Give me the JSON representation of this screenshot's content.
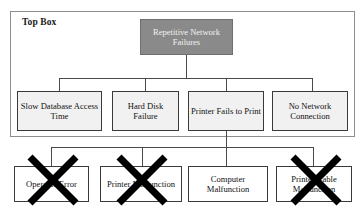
{
  "diagram": {
    "title_label": "Top Box",
    "root": {
      "label": "Repetitive Network Failures",
      "fill_color": "#8a8a8a",
      "text_color": "#f2f2f2"
    },
    "level2": [
      {
        "label": "Slow Database Access Time",
        "struck_out": false
      },
      {
        "label": "Hard Disk Failure",
        "struck_out": false
      },
      {
        "label": "Printer Fails to Print",
        "struck_out": false
      },
      {
        "label": "No Network Connection",
        "struck_out": false
      }
    ],
    "level3": [
      {
        "label": "Operator Error",
        "struck_out": true
      },
      {
        "label": "Printer Malfunction",
        "struck_out": true
      },
      {
        "label": "Computer Malfunction",
        "struck_out": false
      },
      {
        "label": "Printer Cable Malfunction",
        "struck_out": true
      }
    ],
    "colors": {
      "frame_border": "#8d8d8d",
      "node_border": "#3a3a3a",
      "level2_fill": "#f1f1f1",
      "level3_fill": "#ffffff",
      "connector": "#4a4a4a",
      "strike": "#000000"
    }
  }
}
